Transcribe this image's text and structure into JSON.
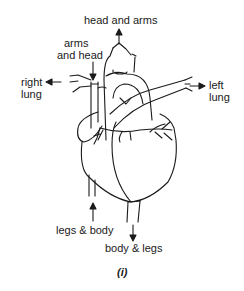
{
  "diagram": {
    "labels": {
      "head_and_arms": "head and arms",
      "arms_and_head_1": "arms",
      "arms_and_head_2": "and head",
      "right_lung_1": "right",
      "right_lung_2": "lung",
      "left_lung_1": "left",
      "left_lung_2": "lung",
      "legs_and_body": "legs & body",
      "body_and_legs": "body & legs"
    },
    "caption": "(i)",
    "colors": {
      "line": "#1a1a1a",
      "background": "#ffffff"
    }
  }
}
